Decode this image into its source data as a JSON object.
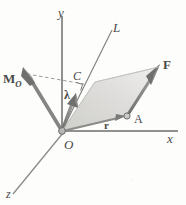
{
  "figure": {
    "background": "#fdfdfc",
    "ink": "#4a4a4a",
    "shade_fill": "#d8d8d4",
    "vector_color": "#7a7a78"
  },
  "labels": {
    "y_axis": "y",
    "x_axis": "x",
    "z_axis": "z",
    "line_L": "L",
    "moment_M": "M",
    "moment_M_sub": "O",
    "point_C": "C",
    "unit_vector_lambda": "λ",
    "force_F": "F",
    "point_A": "A",
    "position_r": "r",
    "origin_O": "O"
  },
  "geometry": {
    "origin": {
      "x": 62,
      "y": 131
    },
    "y_axis_top": {
      "x": 62,
      "y": 16
    },
    "x_axis_right": {
      "x": 178,
      "y": 131
    },
    "z_axis_end": {
      "x": 12,
      "y": 196
    },
    "line_L_end": {
      "x": 112,
      "y": 29
    },
    "M_arrow_tip": {
      "x": 24,
      "y": 75
    },
    "lambda_arrow_tip": {
      "x": 75,
      "y": 95
    },
    "F_arrow_tip": {
      "x": 159,
      "y": 67
    },
    "point_A": {
      "x": 126,
      "y": 116
    },
    "point_C": {
      "x": 85,
      "y": 82
    },
    "parallelogram": [
      {
        "x": 62,
        "y": 131
      },
      {
        "x": 126,
        "y": 116
      },
      {
        "x": 159,
        "y": 67
      },
      {
        "x": 95,
        "y": 82
      }
    ],
    "right_angle_mark": {
      "x": 76,
      "y": 87,
      "size": 7
    },
    "dashed_segment": {
      "from": {
        "x": 26,
        "y": 74
      },
      "to": {
        "x": 84,
        "y": 85
      }
    }
  }
}
